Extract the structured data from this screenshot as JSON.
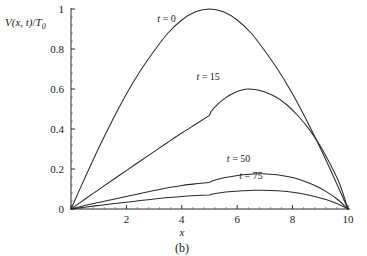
{
  "chart_data": {
    "type": "line",
    "title": "",
    "caption": "(b)",
    "xlabel": "x",
    "ylabel": "V(x, t)/T0",
    "ylabel_parts": {
      "main": "V",
      "arg": "(x, t)",
      "slash": "/",
      "sym": "T",
      "sub": "0"
    },
    "xlim": [
      0,
      10
    ],
    "ylim": [
      0,
      1
    ],
    "grid": false,
    "legend": "inline-labels",
    "xticks": [
      0,
      2,
      4,
      6,
      8,
      10
    ],
    "xticklabels": [
      "",
      "2",
      "4",
      "6",
      "8",
      "10"
    ],
    "yticks": [
      0,
      0.2,
      0.4,
      0.6,
      0.8,
      1
    ],
    "yticklabels": [
      "0",
      "0.2",
      "0.4",
      "0.6",
      "0.8",
      "1"
    ],
    "x_minor_per_major": 5,
    "y_minor_per_major": 5,
    "series": [
      {
        "name": "t = 0",
        "label": "t = 0",
        "label_x": 3.45,
        "label_y": 0.935,
        "peak": {
          "x": 5.0,
          "y": 1.0
        },
        "x": [
          0,
          0.25,
          0.5,
          0.75,
          1,
          1.5,
          2,
          2.5,
          3,
          3.5,
          4,
          4.5,
          5,
          5.5,
          6,
          6.5,
          7,
          7.5,
          8,
          8.5,
          9,
          9.5,
          10
        ],
        "y": [
          0,
          0.078,
          0.155,
          0.231,
          0.305,
          0.445,
          0.575,
          0.69,
          0.79,
          0.88,
          0.945,
          0.986,
          1.0,
          0.986,
          0.945,
          0.88,
          0.79,
          0.69,
          0.575,
          0.445,
          0.305,
          0.155,
          0
        ]
      },
      {
        "name": "t = 15",
        "label": "t = 15",
        "label_x": 4.95,
        "label_y": 0.645,
        "peak": {
          "x": 6.4,
          "y": 0.6
        },
        "kink": {
          "x": 5.0,
          "y": 0.468
        },
        "x": [
          0,
          0.5,
          1,
          1.5,
          2,
          2.5,
          3,
          3.5,
          4,
          4.5,
          5,
          5.05,
          5.3,
          5.6,
          5.9,
          6.2,
          6.4,
          6.7,
          7,
          7.4,
          7.8,
          8.2,
          8.6,
          9,
          9.4,
          9.7,
          10
        ],
        "y": [
          0,
          0.049,
          0.097,
          0.145,
          0.192,
          0.24,
          0.287,
          0.334,
          0.38,
          0.424,
          0.468,
          0.486,
          0.524,
          0.558,
          0.581,
          0.596,
          0.6,
          0.596,
          0.585,
          0.56,
          0.52,
          0.465,
          0.398,
          0.315,
          0.213,
          0.125,
          0
        ]
      },
      {
        "name": "t = 50",
        "label": "t = 50",
        "label_x": 6.05,
        "label_y": 0.235,
        "peak": {
          "x": 6.9,
          "y": 0.176
        },
        "kink": {
          "x": 5.0,
          "y": 0.132
        },
        "x": [
          0,
          0.5,
          1,
          1.5,
          2,
          2.5,
          3,
          3.5,
          4,
          4.5,
          5,
          5.05,
          5.4,
          5.8,
          6.2,
          6.6,
          6.9,
          7.2,
          7.6,
          8,
          8.4,
          8.8,
          9.2,
          9.6,
          10
        ],
        "y": [
          0,
          0.017,
          0.033,
          0.048,
          0.062,
          0.077,
          0.092,
          0.106,
          0.118,
          0.126,
          0.132,
          0.138,
          0.152,
          0.163,
          0.171,
          0.175,
          0.176,
          0.174,
          0.168,
          0.157,
          0.14,
          0.117,
          0.088,
          0.05,
          0
        ]
      },
      {
        "name": "t = 75",
        "label": "t = 75",
        "label_x": 6.5,
        "label_y": 0.152,
        "peak": {
          "x": 6.9,
          "y": 0.094
        },
        "kink": {
          "x": 5.0,
          "y": 0.07
        },
        "x": [
          0,
          0.5,
          1,
          1.5,
          2,
          2.5,
          3,
          3.5,
          4,
          4.5,
          5,
          5.05,
          5.4,
          5.8,
          6.2,
          6.6,
          6.9,
          7.2,
          7.6,
          8,
          8.4,
          8.8,
          9.2,
          9.6,
          10
        ],
        "y": [
          0,
          0.009,
          0.018,
          0.026,
          0.034,
          0.042,
          0.05,
          0.057,
          0.063,
          0.067,
          0.07,
          0.073,
          0.081,
          0.087,
          0.091,
          0.094,
          0.094,
          0.093,
          0.09,
          0.084,
          0.075,
          0.063,
          0.047,
          0.027,
          0
        ]
      }
    ],
    "colors": {
      "axis": "#2a2a2a",
      "curve": "#2b2b2b",
      "background": "#ffffff",
      "text": "#1a1a1a"
    }
  }
}
